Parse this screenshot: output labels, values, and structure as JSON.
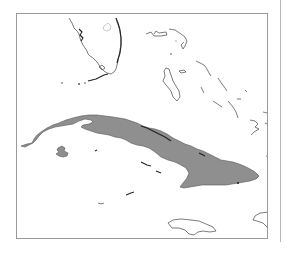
{
  "map": {
    "highlighted_country": "Cuba",
    "colors": {
      "highlight_fill": "#8f8f8f",
      "outline": "#444444",
      "frame": "#9a9a9a",
      "background": "#ffffff"
    },
    "regions": [
      {
        "name": "Cuba",
        "highlighted": true
      },
      {
        "name": "Isla de la Juventud",
        "highlighted": true
      },
      {
        "name": "Florida",
        "highlighted": false
      },
      {
        "name": "Bahamas",
        "highlighted": false
      },
      {
        "name": "Jamaica",
        "highlighted": false
      },
      {
        "name": "Hispaniola",
        "highlighted": false
      },
      {
        "name": "Cayman Islands",
        "highlighted": false
      },
      {
        "name": "Turks and Caicos",
        "highlighted": false
      }
    ]
  }
}
